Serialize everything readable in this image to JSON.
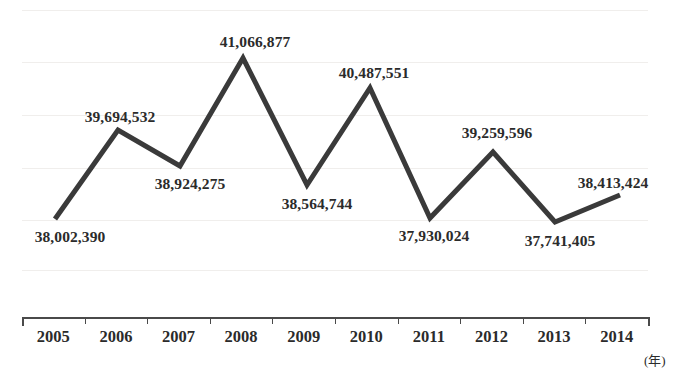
{
  "chart_data": {
    "type": "line",
    "title": "",
    "xlabel": "(年)",
    "ylabel": "",
    "grid": true,
    "legend": "none",
    "categories": [
      "2005",
      "2006",
      "2007",
      "2008",
      "2009",
      "2010",
      "2011",
      "2012",
      "2013",
      "2014"
    ],
    "values": [
      38002390,
      39694532,
      38924275,
      41066877,
      38564744,
      40487551,
      37930024,
      39259596,
      37741405,
      38413424
    ],
    "value_labels": [
      "38,002,390",
      "39,694,532",
      "38,924,275",
      "41,066,877",
      "38,564,744",
      "40,487,551",
      "37,930,024",
      "39,259,596",
      "37,741,405",
      "38,413,424"
    ],
    "ylim": [
      37500000,
      41400000
    ],
    "series": [
      {
        "name": "value",
        "values": [
          38002390,
          39694532,
          38924275,
          41066877,
          38564744,
          40487551,
          37930024,
          39259596,
          37741405,
          38413424
        ]
      }
    ]
  },
  "axis": {
    "unit": "(年)",
    "years": [
      "2005",
      "2006",
      "2007",
      "2008",
      "2009",
      "2010",
      "2011",
      "2012",
      "2013",
      "2014"
    ]
  },
  "style": {
    "line_color": "#3a3a3a",
    "text_color": "#2b2b2b",
    "grid_color": "#f0eeec",
    "axis_color": "#4a4a4a",
    "background": "#ffffff"
  },
  "labels": [
    {
      "text": "38,002,390",
      "x": 70,
      "y": 228
    },
    {
      "text": "39,694,532",
      "x": 120,
      "y": 108
    },
    {
      "text": "38,924,275",
      "x": 190,
      "y": 175
    },
    {
      "text": "41,066,877",
      "x": 255,
      "y": 33
    },
    {
      "text": "38,564,744",
      "x": 317,
      "y": 195
    },
    {
      "text": "40,487,551",
      "x": 374,
      "y": 64
    },
    {
      "text": "37,930,024",
      "x": 434,
      "y": 227
    },
    {
      "text": "39,259,596",
      "x": 497,
      "y": 124
    },
    {
      "text": "37,741,405",
      "x": 560,
      "y": 232
    },
    {
      "text": "38,413,424",
      "x": 613,
      "y": 174
    }
  ],
  "points": [
    {
      "year": "2005",
      "x": 55,
      "y": 219
    },
    {
      "year": "2006",
      "x": 118,
      "y": 130
    },
    {
      "year": "2007",
      "x": 180,
      "y": 166
    },
    {
      "year": "2008",
      "x": 243,
      "y": 58
    },
    {
      "year": "2009",
      "x": 307,
      "y": 185
    },
    {
      "year": "2010",
      "x": 370,
      "y": 88
    },
    {
      "year": "2011",
      "x": 430,
      "y": 218
    },
    {
      "year": "2012",
      "x": 493,
      "y": 152
    },
    {
      "year": "2013",
      "x": 555,
      "y": 222
    },
    {
      "year": "2014",
      "x": 620,
      "y": 195
    }
  ],
  "gridlines_y": [
    10,
    62,
    115,
    168,
    220,
    270
  ]
}
